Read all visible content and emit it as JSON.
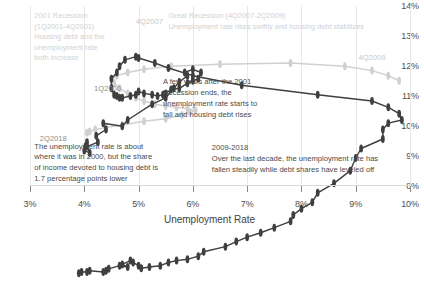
{
  "chart_data": {
    "type": "line",
    "title": "",
    "xlabel": "Unemployment Rate",
    "ylabel": "",
    "xlim": [
      3,
      10
    ],
    "ylim": [
      8,
      14
    ],
    "grid": true,
    "legend": "none",
    "xticks": [
      "3%",
      "4%",
      "5%",
      "6%",
      "7%",
      "8%",
      "9%",
      "10%"
    ],
    "yticks": [
      "8%",
      "9%",
      "10%",
      "11%",
      "12%",
      "13%",
      "14%"
    ],
    "series": [
      {
        "name": "Housing debt service share vs unemployment rate (quarterly 1Q2000-2Q2018)",
        "color": "#3f3f3f",
        "x": [
          4.05,
          4.02,
          4.0,
          4.1,
          4.05,
          4.25,
          4.22,
          4.4,
          4.35,
          4.7,
          4.8,
          5.25,
          5.5,
          5.65,
          5.75,
          5.9,
          5.85,
          6.0,
          6.15,
          6.1,
          6.0,
          5.9,
          5.75,
          5.6,
          5.5,
          5.45,
          5.35,
          5.25,
          5.1,
          5.0,
          4.95,
          4.85,
          4.7,
          4.65,
          4.6,
          4.55,
          4.5,
          4.5,
          4.6,
          4.65,
          4.75,
          4.95,
          5.0,
          5.3,
          5.55,
          6.0,
          6.9,
          8.3,
          9.3,
          9.6,
          9.8,
          9.85,
          9.6,
          9.5,
          9.5,
          9.1,
          9.0,
          8.9,
          8.6,
          8.3,
          8.2,
          8.0,
          7.85,
          7.8,
          7.5,
          7.25,
          7.0,
          6.8,
          6.6,
          6.2,
          6.1,
          5.9,
          5.7,
          5.55,
          5.4,
          5.2,
          5.05,
          5.0,
          4.9,
          4.85,
          4.7,
          4.8,
          4.65,
          4.45,
          4.4,
          4.35,
          4.1,
          4.05,
          3.95,
          3.9
        ],
        "y": [
          11.85,
          11.78,
          11.72,
          11.68,
          11.78,
          11.85,
          11.95,
          12.05,
          12.15,
          12.1,
          12.2,
          12.45,
          12.55,
          12.7,
          12.8,
          12.9,
          12.95,
          13.0,
          12.95,
          12.85,
          12.82,
          12.78,
          12.7,
          12.68,
          12.62,
          12.6,
          12.58,
          12.6,
          12.62,
          12.65,
          12.6,
          12.58,
          12.55,
          12.55,
          12.58,
          12.6,
          12.7,
          12.85,
          12.95,
          13.05,
          13.15,
          13.2,
          13.18,
          13.1,
          13.02,
          12.9,
          12.75,
          12.6,
          12.5,
          12.4,
          12.3,
          12.2,
          12.15,
          12.05,
          11.9,
          11.75,
          11.6,
          11.4,
          11.2,
          11.05,
          10.9,
          10.8,
          10.7,
          10.6,
          10.5,
          10.42,
          10.35,
          10.28,
          10.2,
          10.12,
          10.05,
          10.0,
          9.98,
          9.95,
          9.9,
          9.88,
          9.86,
          9.9,
          9.95,
          9.98,
          9.92,
          9.88,
          9.9,
          9.85,
          9.82,
          9.8,
          9.82,
          9.8,
          9.8,
          9.78
        ]
      },
      {
        "name": "Total debt service share (light gray reference path)",
        "color": "#d0d0d0",
        "x": [
          4.05,
          4.1,
          4.2,
          4.4,
          4.7,
          5.1,
          5.5,
          5.8,
          5.95,
          6.05,
          5.9,
          5.7,
          5.5,
          5.3,
          5.1,
          4.95,
          4.8,
          4.65,
          4.55,
          4.5,
          4.6,
          4.8,
          5.1,
          5.6,
          6.5,
          7.8,
          8.8,
          9.3,
          9.6,
          9.8
        ],
        "y": [
          12.0,
          12.02,
          12.05,
          12.08,
          12.12,
          12.18,
          12.22,
          12.28,
          12.32,
          12.35,
          12.38,
          12.4,
          12.42,
          12.45,
          12.5,
          12.55,
          12.62,
          12.7,
          12.78,
          12.85,
          12.9,
          12.95,
          13.0,
          13.05,
          13.08,
          13.1,
          13.05,
          12.98,
          12.9,
          12.82
        ]
      }
    ],
    "point_labels": [
      {
        "id": "1q2000",
        "text": "1Q2000",
        "x": 4.18,
        "y": 11.4,
        "faint": false
      },
      {
        "id": "4q2007",
        "text": "4Q2007",
        "x": 4.95,
        "y": 13.62,
        "faint": true
      },
      {
        "id": "4q2009",
        "text": "4Q2009",
        "x": 9.05,
        "y": 12.45,
        "faint": true
      },
      {
        "id": "2q2018",
        "text": "2Q2018",
        "x": 3.18,
        "y": 9.72,
        "faint": false
      }
    ],
    "annotations": [
      {
        "id": "recession-2001",
        "text": "2001 Recession\n(1Q2001-4Q2001)\nHousing debt and the\nunemployment rate\nboth increase",
        "tone": "faint",
        "x": 3.08,
        "y": 13.82
      },
      {
        "id": "great-recession",
        "text": "Great Recession (4Q2007-2Q2009)\nUnemployment rate rises swiftly and housing debt stabilizes",
        "tone": "faint",
        "x": 5.55,
        "y": 13.82
      },
      {
        "id": "post-2001-recovery",
        "text": "A few years after the 2001\nRecession ends, the\nunemployment rate starts to\nfall and housing debt rises",
        "tone": "dark",
        "x": 5.45,
        "y": 11.62
      },
      {
        "id": "debt-share-2018",
        "text": "The unemployment rate is about\nwhere it was in 2000, but the share\nof income devoted to housing debt is\n1.7 percentage points lower",
        "tone": "dark",
        "x": 3.08,
        "y": 9.48
      },
      {
        "id": "decade-2009-2018",
        "text": "2009-2018\nOver the last decade, the unemployment rate has\nfallen steadily while debt shares have leveled off",
        "tone": "dark",
        "x": 6.35,
        "y": 9.42
      }
    ]
  }
}
